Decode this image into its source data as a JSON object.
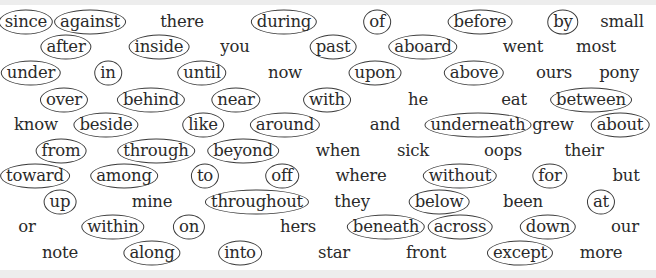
{
  "worksheet": {
    "background": "#ffffff",
    "text_color": "#2a2a2a",
    "circle_color": "#3a3a3a",
    "rows": [
      {
        "y": 22,
        "words": [
          {
            "text": "since",
            "x": 26,
            "circled": true
          },
          {
            "text": "against",
            "x": 90,
            "circled": true
          },
          {
            "text": "there",
            "x": 182,
            "circled": false
          },
          {
            "text": "during",
            "x": 284,
            "circled": true
          },
          {
            "text": "of",
            "x": 377,
            "circled": true
          },
          {
            "text": "before",
            "x": 480,
            "circled": true
          },
          {
            "text": "by",
            "x": 563,
            "circled": true
          },
          {
            "text": "small",
            "x": 622,
            "circled": false
          }
        ]
      },
      {
        "y": 47,
        "words": [
          {
            "text": "after",
            "x": 66,
            "circled": true
          },
          {
            "text": "inside",
            "x": 159,
            "circled": true
          },
          {
            "text": "you",
            "x": 235,
            "circled": false
          },
          {
            "text": "past",
            "x": 333,
            "circled": true
          },
          {
            "text": "aboard",
            "x": 423,
            "circled": true
          },
          {
            "text": "went",
            "x": 523,
            "circled": false
          },
          {
            "text": "most",
            "x": 596,
            "circled": false
          }
        ]
      },
      {
        "y": 73,
        "words": [
          {
            "text": "under",
            "x": 31,
            "circled": true
          },
          {
            "text": "in",
            "x": 108,
            "circled": true
          },
          {
            "text": "until",
            "x": 202,
            "circled": true
          },
          {
            "text": "now",
            "x": 285,
            "circled": false
          },
          {
            "text": "upon",
            "x": 375,
            "circled": true
          },
          {
            "text": "above",
            "x": 474,
            "circled": true
          },
          {
            "text": "ours",
            "x": 554,
            "circled": false
          },
          {
            "text": "pony",
            "x": 619,
            "circled": false
          }
        ]
      },
      {
        "y": 100,
        "words": [
          {
            "text": "over",
            "x": 64,
            "circled": true
          },
          {
            "text": "behind",
            "x": 151,
            "circled": true
          },
          {
            "text": "near",
            "x": 236,
            "circled": true
          },
          {
            "text": "with",
            "x": 327,
            "circled": true
          },
          {
            "text": "he",
            "x": 418,
            "circled": false
          },
          {
            "text": "eat",
            "x": 514,
            "circled": false
          },
          {
            "text": "between",
            "x": 591,
            "circled": true
          }
        ]
      },
      {
        "y": 125,
        "words": [
          {
            "text": "know",
            "x": 36,
            "circled": false
          },
          {
            "text": "beside",
            "x": 106,
            "circled": true
          },
          {
            "text": "like",
            "x": 203,
            "circled": true
          },
          {
            "text": "around",
            "x": 285,
            "circled": true
          },
          {
            "text": "and",
            "x": 385,
            "circled": false
          },
          {
            "text": "underneath",
            "x": 478,
            "circled": true
          },
          {
            "text": "grew",
            "x": 553,
            "circled": false
          },
          {
            "text": "about",
            "x": 620,
            "circled": true
          }
        ]
      },
      {
        "y": 151,
        "words": [
          {
            "text": "from",
            "x": 61,
            "circled": true
          },
          {
            "text": "through",
            "x": 156,
            "circled": true
          },
          {
            "text": "beyond",
            "x": 243,
            "circled": true
          },
          {
            "text": "when",
            "x": 338,
            "circled": false
          },
          {
            "text": "sick",
            "x": 413,
            "circled": false
          },
          {
            "text": "oops",
            "x": 503,
            "circled": false
          },
          {
            "text": "their",
            "x": 584,
            "circled": false
          }
        ]
      },
      {
        "y": 176,
        "words": [
          {
            "text": "toward",
            "x": 35,
            "circled": true
          },
          {
            "text": "among",
            "x": 124,
            "circled": true
          },
          {
            "text": "to",
            "x": 205,
            "circled": true
          },
          {
            "text": "off",
            "x": 282,
            "circled": true
          },
          {
            "text": "where",
            "x": 361,
            "circled": false
          },
          {
            "text": "without",
            "x": 460,
            "circled": true
          },
          {
            "text": "for",
            "x": 550,
            "circled": true
          },
          {
            "text": "but",
            "x": 626,
            "circled": false
          }
        ]
      },
      {
        "y": 202,
        "words": [
          {
            "text": "up",
            "x": 60,
            "circled": true
          },
          {
            "text": "mine",
            "x": 152,
            "circled": false
          },
          {
            "text": "throughout",
            "x": 257,
            "circled": true
          },
          {
            "text": "they",
            "x": 352,
            "circled": false
          },
          {
            "text": "below",
            "x": 439,
            "circled": true
          },
          {
            "text": "been",
            "x": 523,
            "circled": false
          },
          {
            "text": "at",
            "x": 601,
            "circled": true
          }
        ]
      },
      {
        "y": 227,
        "words": [
          {
            "text": "or",
            "x": 27,
            "circled": false
          },
          {
            "text": "within",
            "x": 113,
            "circled": true
          },
          {
            "text": "on",
            "x": 189,
            "circled": true
          },
          {
            "text": "hers",
            "x": 298,
            "circled": false
          },
          {
            "text": "beneath",
            "x": 386,
            "circled": true
          },
          {
            "text": "across",
            "x": 460,
            "circled": true
          },
          {
            "text": "down",
            "x": 548,
            "circled": true
          },
          {
            "text": "our",
            "x": 625,
            "circled": false
          }
        ]
      },
      {
        "y": 253,
        "words": [
          {
            "text": "note",
            "x": 60,
            "circled": false
          },
          {
            "text": "along",
            "x": 152,
            "circled": true
          },
          {
            "text": "into",
            "x": 240,
            "circled": true
          },
          {
            "text": "star",
            "x": 334,
            "circled": false
          },
          {
            "text": "front",
            "x": 426,
            "circled": false
          },
          {
            "text": "except",
            "x": 520,
            "circled": true
          },
          {
            "text": "more",
            "x": 601,
            "circled": false
          }
        ]
      }
    ]
  }
}
